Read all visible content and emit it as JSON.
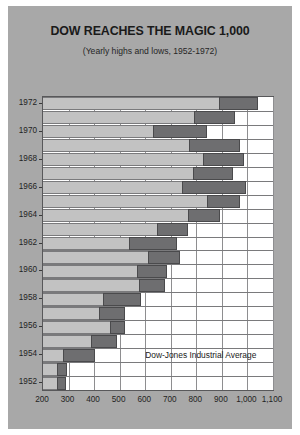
{
  "card": {
    "background_color": "#a8a8a8"
  },
  "chart_data": {
    "type": "bar",
    "orientation": "horizontal",
    "subtype": "floating-range-bar",
    "title": "DOW REACHES THE MAGIC 1,000",
    "subtitle": "(Yearly highs and lows, 1952-1972)",
    "annotation": "Dow-Jones Industrial Average",
    "xlabel": "",
    "ylabel": "",
    "xlim": [
      200,
      1100
    ],
    "xtick_step": 100,
    "xticks": [
      200,
      300,
      400,
      500,
      600,
      700,
      800,
      900,
      1000,
      1100
    ],
    "xtick_labels": [
      "200",
      "300",
      "400",
      "500",
      "600",
      "700",
      "800",
      "900",
      "1,000",
      "1,100"
    ],
    "ylim": [
      1951.5,
      1972.5
    ],
    "yticks": [
      1952,
      1954,
      1956,
      1958,
      1960,
      1962,
      1964,
      1966,
      1968,
      1970,
      1972
    ],
    "ytick_labels": [
      "1952",
      "1954",
      "1956",
      "1958",
      "1960",
      "1962",
      "1964",
      "1966",
      "1968",
      "1970",
      "1972"
    ],
    "grid": "vertical",
    "legend": "none",
    "bar_color": "#6e6e70",
    "band_color": "#c2c2c2",
    "categories": [
      1972,
      1971,
      1970,
      1969,
      1968,
      1967,
      1966,
      1965,
      1964,
      1963,
      1962,
      1961,
      1960,
      1959,
      1958,
      1957,
      1956,
      1955,
      1954,
      1953,
      1952
    ],
    "series": [
      {
        "name": "Yearly low",
        "values": [
          890,
          790,
          630,
          770,
          825,
          786,
          745,
          840,
          766,
          646,
          536,
          610,
          566,
          574,
          436,
          420,
          462,
          388,
          279,
          255,
          256
        ]
      },
      {
        "name": "Yearly high",
        "values": [
          1040,
          950,
          842,
          970,
          985,
          943,
          995,
          970,
          891,
          767,
          726,
          735,
          685,
          679,
          584,
          521,
          521,
          488,
          404,
          294,
          292
        ]
      }
    ],
    "ranges": [
      {
        "year": 1972,
        "low": 890,
        "high": 1040
      },
      {
        "year": 1971,
        "low": 790,
        "high": 950
      },
      {
        "year": 1970,
        "low": 630,
        "high": 842
      },
      {
        "year": 1969,
        "low": 770,
        "high": 970
      },
      {
        "year": 1968,
        "low": 825,
        "high": 985
      },
      {
        "year": 1967,
        "low": 786,
        "high": 943
      },
      {
        "year": 1966,
        "low": 745,
        "high": 995
      },
      {
        "year": 1965,
        "low": 840,
        "high": 970
      },
      {
        "year": 1964,
        "low": 766,
        "high": 891
      },
      {
        "year": 1963,
        "low": 646,
        "high": 767
      },
      {
        "year": 1962,
        "low": 536,
        "high": 726
      },
      {
        "year": 1961,
        "low": 610,
        "high": 735
      },
      {
        "year": 1960,
        "low": 566,
        "high": 685
      },
      {
        "year": 1959,
        "low": 574,
        "high": 679
      },
      {
        "year": 1958,
        "low": 436,
        "high": 584
      },
      {
        "year": 1957,
        "low": 420,
        "high": 521
      },
      {
        "year": 1956,
        "low": 462,
        "high": 521
      },
      {
        "year": 1955,
        "low": 388,
        "high": 488
      },
      {
        "year": 1954,
        "low": 279,
        "high": 404
      },
      {
        "year": 1953,
        "low": 255,
        "high": 294
      },
      {
        "year": 1952,
        "low": 256,
        "high": 292
      }
    ]
  }
}
